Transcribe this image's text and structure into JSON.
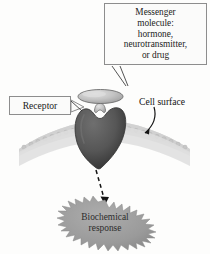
{
  "figure": {
    "background_color": "#fdfdfc"
  },
  "callouts": {
    "messenger": {
      "lines": [
        "Messenger",
        "molecule:",
        "hormone,",
        "neurotransmitter,",
        "or drug"
      ],
      "border_color": "#8d8d8d",
      "fill_color": "#fbfbfa"
    },
    "receptor": {
      "label": "Receptor",
      "border_color": "#8d8d8d",
      "fill_color": "#fbfbfa"
    },
    "cell_surface": {
      "label": "Cell surface"
    }
  },
  "shapes": {
    "messenger_molecule": {
      "name": "messenger-molecule",
      "fill_color": "#b9b9b9",
      "outline_color": "#6e6e6e"
    },
    "receptor": {
      "name": "receptor-protein",
      "fill_color": "#5a5a5a",
      "outline_color": "#3a3a3a"
    },
    "cell_surface": {
      "name": "cell-surface-membrane",
      "fill_color": "#d7d7d7",
      "edge_color": "#a9a9a9"
    },
    "response_burst": {
      "name": "biochemical-response-burst",
      "fill_color": "#9a9a9a",
      "lines": [
        "Biochemical",
        "response"
      ],
      "text_color": "#2c2c2c"
    },
    "signal_arrow": {
      "name": "signal-transduction-arrow",
      "style": "dashed",
      "color": "#1a1a1a"
    },
    "cell_surface_arrow": {
      "name": "cell-surface-pointer-arrow",
      "style": "solid-curved",
      "color": "#1a1a1a"
    }
  }
}
